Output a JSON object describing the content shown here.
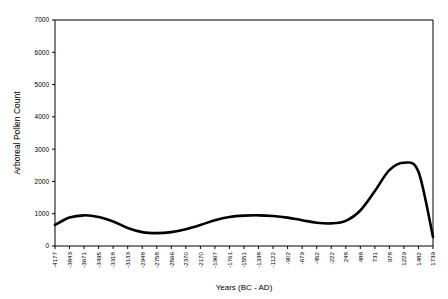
{
  "chart_data": {
    "type": "line",
    "title": "",
    "xlabel": "Years (BC - AD)",
    "ylabel": "Arboreal Pollen Count",
    "ylim": [
      0,
      7000
    ],
    "ytick_labels": [
      "0",
      "1000",
      "2000",
      "3000",
      "4000",
      "5000",
      "6000",
      "7000"
    ],
    "yticks": [
      0,
      1000,
      2000,
      3000,
      4000,
      5000,
      6000,
      7000
    ],
    "grid": false,
    "legend": "none",
    "categories": [
      "-4177",
      "-3843",
      "-3671",
      "-3495",
      "-3318",
      "-3133",
      "-2948",
      "-2758",
      "-2566",
      "-2370",
      "-2170",
      "-1967",
      "-1761",
      "-1551",
      "-1338",
      "-1122",
      "-902",
      "-679",
      "-452",
      "-222",
      "248",
      "488",
      "731",
      "978",
      "1229",
      "1482",
      "1739"
    ],
    "values": [
      650,
      880,
      950,
      900,
      760,
      560,
      430,
      400,
      430,
      520,
      650,
      800,
      900,
      940,
      950,
      930,
      880,
      800,
      720,
      700,
      780,
      1100,
      1700,
      2350,
      2580,
      2300,
      280
    ],
    "series": [
      {
        "name": "Arboreal Pollen Count",
        "values": [
          650,
          880,
          950,
          900,
          760,
          560,
          430,
          400,
          430,
          520,
          650,
          800,
          900,
          940,
          950,
          930,
          880,
          800,
          720,
          700,
          780,
          1100,
          1700,
          2350,
          2580,
          2300,
          280
        ]
      }
    ],
    "line_color": "#000000",
    "line_width": 2.6
  }
}
